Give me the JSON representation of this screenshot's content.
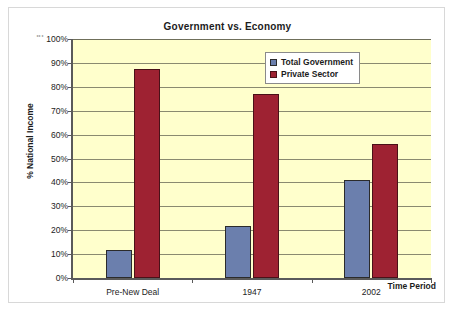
{
  "chart_data": {
    "type": "bar",
    "title": "Government vs. Economy",
    "xlabel": "Time Period",
    "ylabel": "% National Income",
    "categories": [
      "Pre-New Deal",
      "1947",
      "2002"
    ],
    "series": [
      {
        "name": "Total Government",
        "color": "#6B7FAD",
        "values": [
          11.7,
          21.8,
          41.0
        ]
      },
      {
        "name": "Private Sector",
        "color": "#9E2232",
        "values": [
          87.5,
          77.2,
          56.0
        ]
      }
    ],
    "ylim": [
      0,
      100
    ],
    "y_tick_labels": [
      "100%",
      "90%",
      "80%",
      "70%",
      "60%",
      "50%",
      "40%",
      "30%",
      "20%",
      "10%",
      "0%"
    ],
    "y_tick_values": [
      100,
      90,
      80,
      70,
      60,
      50,
      40,
      30,
      20,
      10,
      0
    ],
    "grid": true,
    "legend_position": "top-right",
    "plot_background": "#FFFFCC",
    "axis_color": "#5A5A5A",
    "y_axis_ornament": "⋮"
  }
}
